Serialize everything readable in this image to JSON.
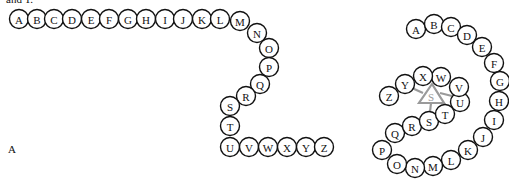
{
  "top_text_fragment": "and T.",
  "panel_label": "A",
  "colors": {
    "bead_stroke": "#111111",
    "bead_fill": "#ffffff",
    "binding_site": "#9a9a9a"
  },
  "bead_radius": 9.5,
  "left_chain": {
    "description": "Unfolded linear chain of residues A-Z",
    "beads": [
      {
        "label": "A",
        "x": 19,
        "y": 19
      },
      {
        "label": "B",
        "x": 37,
        "y": 19
      },
      {
        "label": "C",
        "x": 54,
        "y": 19
      },
      {
        "label": "D",
        "x": 72,
        "y": 19
      },
      {
        "label": "E",
        "x": 91,
        "y": 19
      },
      {
        "label": "F",
        "x": 109,
        "y": 19
      },
      {
        "label": "G",
        "x": 128,
        "y": 19
      },
      {
        "label": "H",
        "x": 146,
        "y": 19
      },
      {
        "label": "I",
        "x": 165,
        "y": 19
      },
      {
        "label": "J",
        "x": 183,
        "y": 19
      },
      {
        "label": "K",
        "x": 202,
        "y": 19
      },
      {
        "label": "L",
        "x": 220,
        "y": 19
      },
      {
        "label": "M",
        "x": 240,
        "y": 21
      },
      {
        "label": "N",
        "x": 257,
        "y": 33
      },
      {
        "label": "O",
        "x": 269,
        "y": 48
      },
      {
        "label": "P",
        "x": 269,
        "y": 67
      },
      {
        "label": "Q",
        "x": 260,
        "y": 84
      },
      {
        "label": "R",
        "x": 246,
        "y": 96
      },
      {
        "label": "S",
        "x": 230,
        "y": 106
      },
      {
        "label": "T",
        "x": 230,
        "y": 126
      },
      {
        "label": "U",
        "x": 230,
        "y": 147
      },
      {
        "label": "V",
        "x": 249,
        "y": 147
      },
      {
        "label": "W",
        "x": 268,
        "y": 147
      },
      {
        "label": "X",
        "x": 287,
        "y": 147
      },
      {
        "label": "Y",
        "x": 306,
        "y": 147
      },
      {
        "label": "Z",
        "x": 324,
        "y": 147
      }
    ]
  },
  "right_chain": {
    "description": "Folded chain forming a binding site from Y, U and S",
    "beads": [
      {
        "label": "A",
        "x": 416,
        "y": 29
      },
      {
        "label": "B",
        "x": 434,
        "y": 24
      },
      {
        "label": "C",
        "x": 451,
        "y": 27
      },
      {
        "label": "D",
        "x": 467,
        "y": 35
      },
      {
        "label": "E",
        "x": 482,
        "y": 47
      },
      {
        "label": "F",
        "x": 494,
        "y": 63
      },
      {
        "label": "G",
        "x": 500,
        "y": 81
      },
      {
        "label": "H",
        "x": 499,
        "y": 101
      },
      {
        "label": "I",
        "x": 494,
        "y": 120
      },
      {
        "label": "J",
        "x": 483,
        "y": 137
      },
      {
        "label": "K",
        "x": 468,
        "y": 150
      },
      {
        "label": "L",
        "x": 451,
        "y": 160
      },
      {
        "label": "M",
        "x": 433,
        "y": 166
      },
      {
        "label": "N",
        "x": 415,
        "y": 168
      },
      {
        "label": "O",
        "x": 397,
        "y": 164
      },
      {
        "label": "P",
        "x": 382,
        "y": 150
      },
      {
        "label": "Q",
        "x": 395,
        "y": 133
      },
      {
        "label": "R",
        "x": 412,
        "y": 126
      },
      {
        "label": "S",
        "x": 429,
        "y": 121
      },
      {
        "label": "T",
        "x": 445,
        "y": 114
      },
      {
        "label": "U",
        "x": 460,
        "y": 102
      },
      {
        "label": "V",
        "x": 459,
        "y": 87
      },
      {
        "label": "W",
        "x": 441,
        "y": 77
      },
      {
        "label": "X",
        "x": 423,
        "y": 76
      },
      {
        "label": "Y",
        "x": 405,
        "y": 84
      },
      {
        "label": "Z",
        "x": 389,
        "y": 96
      }
    ],
    "binding_site": {
      "label": "S",
      "triangle": {
        "apex": [
          432,
          84
        ],
        "left": [
          419,
          103
        ],
        "right": [
          444,
          103
        ]
      },
      "center": [
        431,
        97
      ],
      "connections": [
        {
          "to": "Y",
          "from": [
            423,
            93
          ],
          "end": [
            412,
            88
          ]
        },
        {
          "to": "U",
          "from": [
            440,
            93
          ],
          "end": [
            452,
            96
          ]
        },
        {
          "to": "S",
          "from": [
            431,
            103
          ],
          "end": [
            430,
            112
          ]
        }
      ]
    }
  }
}
